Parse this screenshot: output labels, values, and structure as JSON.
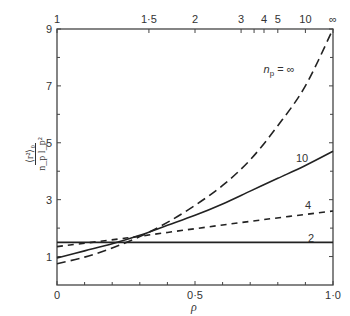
{
  "chart_data": {
    "type": "line",
    "title": "",
    "xlabel": "ρ",
    "ylabel": "⟨r²⟩₀ / (n_p l_p²)",
    "xlim": [
      0,
      1.0
    ],
    "ylim": [
      0,
      9
    ],
    "grid": false,
    "x_ticks": [
      {
        "value": 0,
        "label": "0"
      },
      {
        "value": 0.5,
        "label": "0·5"
      },
      {
        "value": 1.0,
        "label": "1·0"
      }
    ],
    "x_minor_ticks": [
      0.1,
      0.2,
      0.3,
      0.4,
      0.6,
      0.7,
      0.8,
      0.9
    ],
    "y_ticks": [
      {
        "value": 1,
        "label": "1"
      },
      {
        "value": 3,
        "label": "3"
      },
      {
        "value": 5,
        "label": "5"
      },
      {
        "value": 7,
        "label": "7"
      },
      {
        "value": 9,
        "label": "9"
      }
    ],
    "y_minor_ticks": [
      2,
      4,
      6,
      8
    ],
    "top_axis": {
      "label": "n_p",
      "ticks": [
        {
          "n": "1",
          "rho": 0.0
        },
        {
          "n": "1·5",
          "rho": 0.333
        },
        {
          "n": "2",
          "rho": 0.5
        },
        {
          "n": "3",
          "rho": 0.667
        },
        {
          "n": "",
          "rho": 0.714
        },
        {
          "n": "4",
          "rho": 0.75
        },
        {
          "n": "5",
          "rho": 0.8
        },
        {
          "n": "10",
          "rho": 0.9
        },
        {
          "n": "∞",
          "rho": 1.0
        }
      ]
    },
    "series": [
      {
        "name": "n_p = ∞",
        "label": "n_p = ∞",
        "style": "long-dash",
        "x": [
          0,
          0.1,
          0.2,
          0.3,
          0.4,
          0.5,
          0.6,
          0.7,
          0.8,
          0.9,
          1.0
        ],
        "values": [
          0.75,
          0.98,
          1.3,
          1.7,
          2.2,
          2.8,
          3.5,
          4.4,
          5.6,
          7.0,
          9.0
        ]
      },
      {
        "name": "n_p = 10",
        "label": "10",
        "style": "solid",
        "x": [
          0,
          0.1,
          0.2,
          0.3,
          0.4,
          0.5,
          0.6,
          0.7,
          0.8,
          0.9,
          1.0
        ],
        "values": [
          0.95,
          1.2,
          1.45,
          1.75,
          2.1,
          2.45,
          2.85,
          3.3,
          3.75,
          4.2,
          4.7
        ]
      },
      {
        "name": "n_p = 4",
        "label": "4",
        "style": "short-dash",
        "x": [
          0,
          0.25,
          0.5,
          0.75,
          1.0
        ],
        "values": [
          1.35,
          1.65,
          1.98,
          2.3,
          2.6
        ]
      },
      {
        "name": "n_p = 2",
        "label": "2",
        "style": "solid",
        "x": [
          0,
          1.0
        ],
        "values": [
          1.5,
          1.5
        ]
      }
    ]
  },
  "labels": {
    "xlabel": "ρ",
    "ylabel_num": "⟨r²⟩₀",
    "ylabel_den": "n_p l_p²"
  }
}
